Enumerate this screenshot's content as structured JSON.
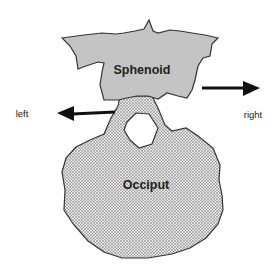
{
  "diagram": {
    "bones": [
      {
        "name": "Sphenoid",
        "fill": "#c4c4c4"
      },
      {
        "name": "Occiput",
        "fill": "#d6d6d6"
      }
    ],
    "arrows": [
      {
        "label": "left",
        "direction": "left"
      },
      {
        "label": "right",
        "direction": "right"
      }
    ],
    "colors": {
      "outline": "#333333",
      "arrow": "#111111",
      "text": "#222222",
      "stipple": "#555555"
    }
  }
}
